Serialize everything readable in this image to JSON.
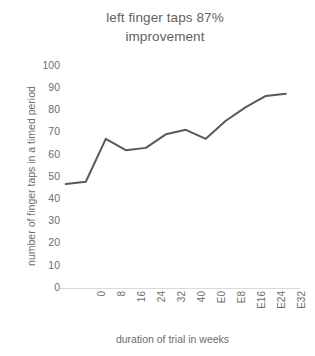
{
  "chart_data": {
    "type": "line",
    "title": "left finger taps 87%\nimprovement",
    "title_line1": "left finger taps 87%",
    "title_line2": "improvement",
    "xlabel": "duration of trial in weeks",
    "ylabel": "number of finger taps in a timed period",
    "categories": [
      "0",
      "8",
      "16",
      "24",
      "32",
      "40",
      "E0",
      "E8",
      "E16",
      "E24",
      "E32",
      "E40"
    ],
    "values": [
      46,
      47,
      66,
      61,
      62,
      68,
      70,
      66,
      74,
      80,
      85,
      86
    ],
    "series": [
      {
        "name": "left finger taps",
        "values": [
          46,
          47,
          66,
          61,
          62,
          68,
          70,
          66,
          74,
          80,
          85,
          86
        ]
      }
    ],
    "ylim": [
      0,
      100
    ],
    "ytick_step": 10,
    "yticks": [
      "100",
      "90",
      "80",
      "70",
      "60",
      "50",
      "40",
      "30",
      "20",
      "10",
      "0"
    ],
    "grid": false,
    "legend": "none",
    "line_color": "#595959",
    "line_width": 2,
    "markers": false,
    "xtick_rotation": -90,
    "axis_text_color": "#6e6e6e",
    "background_color": "#ffffff"
  }
}
